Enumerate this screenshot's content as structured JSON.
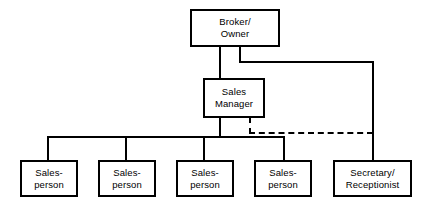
{
  "diagram": {
    "type": "organization-chart",
    "colors": {
      "background": "#ffffff",
      "line": "#000000",
      "box_fill": "#ffffff",
      "text": "#000000"
    },
    "nodes": [
      {
        "id": "broker-owner",
        "label": "Broker/\nOwner",
        "level": 0,
        "x": 190,
        "y": 9,
        "w": 90,
        "h": 38
      },
      {
        "id": "sales-manager",
        "label": "Sales\nManager",
        "level": 1,
        "x": 203,
        "y": 78,
        "w": 62,
        "h": 40
      },
      {
        "id": "salesperson-1",
        "label": "Sales-\nperson",
        "level": 2,
        "x": 20,
        "y": 160,
        "w": 58,
        "h": 37
      },
      {
        "id": "salesperson-2",
        "label": "Sales-\nperson",
        "level": 2,
        "x": 98,
        "y": 160,
        "w": 58,
        "h": 37
      },
      {
        "id": "salesperson-3",
        "label": "Sales-\nperson",
        "level": 2,
        "x": 176,
        "y": 160,
        "w": 58,
        "h": 37
      },
      {
        "id": "salesperson-4",
        "label": "Sales-\nperson",
        "level": 2,
        "x": 254,
        "y": 160,
        "w": 58,
        "h": 37
      },
      {
        "id": "secretary-receptionist",
        "label": "Secretary/\nReceptionist",
        "level": 2,
        "x": 333,
        "y": 160,
        "w": 79,
        "h": 37
      }
    ],
    "connections": [
      {
        "id": "broker-to-sales-manager",
        "from": "broker-owner",
        "to": "sales-manager",
        "style": "solid"
      },
      {
        "id": "broker-to-secretary",
        "from": "broker-owner",
        "to": "secretary-receptionist",
        "style": "solid"
      },
      {
        "id": "sales-manager-to-salespeople",
        "from": "sales-manager",
        "to": "salesperson-bus",
        "style": "solid"
      },
      {
        "id": "sales-manager-to-secretary-dotted",
        "from": "sales-manager",
        "to": "secretary-receptionist",
        "style": "dashed"
      }
    ]
  }
}
